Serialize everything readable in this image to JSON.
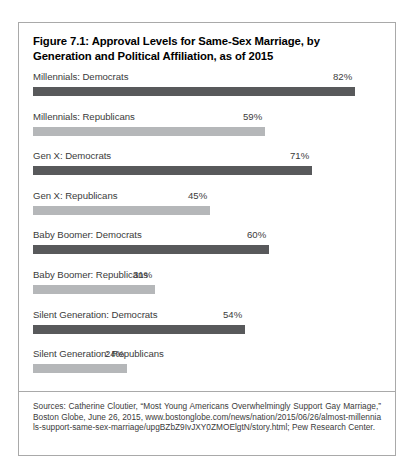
{
  "figure": {
    "title": "Figure 7.1: Approval Levels for Same-Sex Marriage, by Generation and Political Affiliation, as of 2015",
    "source_note": "Sources: Catherine Cloutier, “Most Young Americans Overwhelmingly Support Gay Marriage,” Boston Globe, June 26, 2015, www.bostonglobe.com/news/nation/2015/06/26/almost-millennials-support-same-sex-marriage/upgBZbZ9IvJXY0ZMOElgtN/story.html; Pew Research Center."
  },
  "colors": {
    "democrat_bar": "#58595b",
    "republican_bar": "#b5b7b9",
    "card_border": "#a9a9a9",
    "text": "#3b3b3b",
    "title_text": "#000000",
    "background": "#ffffff"
  },
  "chart_data": {
    "type": "bar",
    "orientation": "horizontal",
    "title": "Figure 7.1: Approval Levels for Same-Sex Marriage, by Generation and Political Affiliation, as of 2015",
    "xlabel": "",
    "ylabel": "",
    "xlim": [
      0,
      100
    ],
    "grid": false,
    "legend": "none",
    "value_suffix": "%",
    "categories": [
      "Millennials: Democrats",
      "Millennials: Republicans",
      "Gen X: Democrats",
      "Gen X: Republicans",
      "Baby Boomer: Democrats",
      "Baby Boomer: Republicans",
      "Silent Generation: Democrats",
      "Silent Generation: Republicans"
    ],
    "values": [
      82,
      59,
      71,
      45,
      60,
      31,
      54,
      24
    ],
    "rows": [
      {
        "label": "Millennials: Democrats",
        "value": 82,
        "value_label": "82%",
        "party": "dem"
      },
      {
        "label": "Millennials: Republicans",
        "value": 59,
        "value_label": "59%",
        "party": "rep"
      },
      {
        "label": "Gen X: Democrats",
        "value": 71,
        "value_label": "71%",
        "party": "dem"
      },
      {
        "label": "Gen X: Republicans",
        "value": 45,
        "value_label": "45%",
        "party": "rep"
      },
      {
        "label": "Baby Boomer: Democrats",
        "value": 60,
        "value_label": "60%",
        "party": "dem"
      },
      {
        "label": "Baby Boomer: Republicans",
        "value": 31,
        "value_label": "31%",
        "party": "rep"
      },
      {
        "label": "Silent Generation: Democrats",
        "value": 54,
        "value_label": "54%",
        "party": "dem"
      },
      {
        "label": "Silent Generation: Republicans",
        "value": 24,
        "value_label": "24%",
        "party": "rep"
      }
    ]
  }
}
